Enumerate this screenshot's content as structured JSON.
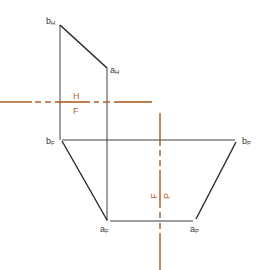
{
  "colors": {
    "object_line": "#2a2a2a",
    "fold_line": "#a8561a",
    "background": "#ffffff"
  },
  "points": {
    "bH": {
      "base": "b",
      "sub": "H"
    },
    "aH": {
      "base": "a",
      "sub": "H"
    },
    "bF": {
      "base": "b",
      "sub": "F"
    },
    "bP": {
      "base": "b",
      "sub": "P"
    },
    "aF": {
      "base": "a",
      "sub": "F"
    },
    "aP": {
      "base": "a",
      "sub": "P"
    }
  },
  "fold_lines": {
    "horizontal": {
      "above": "H",
      "below": "F"
    },
    "vertical": {
      "left": "F",
      "right": "P"
    }
  }
}
